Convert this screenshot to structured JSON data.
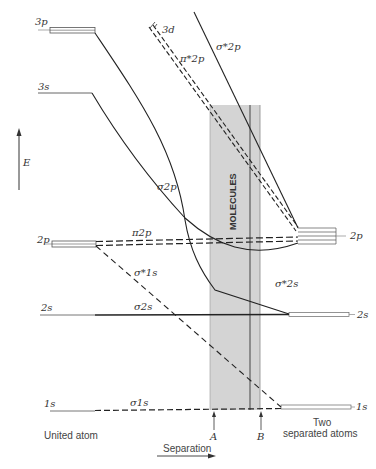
{
  "diagram": {
    "axis": {
      "energy_label": "E",
      "separation_label": "Separation"
    },
    "region": {
      "label": "MOLECULES",
      "fill": "#d4d4d4",
      "markers": [
        "A",
        "B"
      ]
    },
    "left_levels": {
      "heading": "United atom",
      "items": [
        "3p",
        "3s",
        "2p",
        "2s",
        "1s"
      ],
      "extra": "3d"
    },
    "right_levels": {
      "heading_line1": "Two",
      "heading_line2": "separated atoms",
      "items": [
        "2p",
        "2s",
        "1s"
      ]
    },
    "orbitals": {
      "sigma_star_2p": "σ*2p",
      "pi_star_2p": "π*2p",
      "sigma_2p": "σ2p",
      "pi_2p": "π2p",
      "sigma_star_1s": "σ*1s",
      "sigma_star_2s": "σ*2s",
      "sigma_2s": "σ2s",
      "sigma_1s": "σ1s"
    },
    "colors": {
      "line": "#222222",
      "shade": "#d4d4d4",
      "text": "#333333"
    }
  }
}
